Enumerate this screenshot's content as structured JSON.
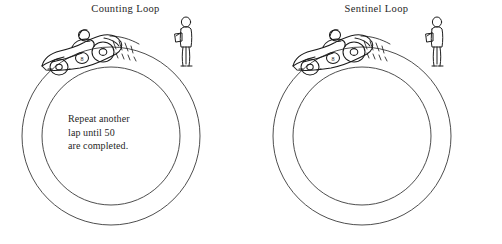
{
  "figure": {
    "background_color": "#ffffff",
    "ink_color": "#2b2b2b",
    "panels": [
      {
        "id": "counting-loop",
        "title": "Counting Loop",
        "caption": "Repeat another\nlap until 50\nare completed.",
        "track": {
          "outer_radius": 89,
          "inner_radius": 69,
          "center_x": 111,
          "center_y": 136
        },
        "icons": {
          "car": "race-car-icon",
          "driver": "driver-icon",
          "speed_lines": "speed-lines-icon",
          "observer": "standing-observer-icon"
        }
      },
      {
        "id": "sentinel-loop",
        "title": "Sentinel Loop",
        "caption": "While the car\nisn't broken\ndo another lap.",
        "track": {
          "outer_radius": 89,
          "inner_radius": 69,
          "center_x": 111,
          "center_y": 136
        },
        "icons": {
          "car": "race-car-icon",
          "driver": "driver-icon",
          "speed_lines": "speed-lines-icon",
          "observer": "standing-observer-icon"
        }
      }
    ]
  }
}
